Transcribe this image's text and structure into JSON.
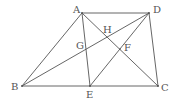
{
  "diagram": {
    "type": "geometry-figure",
    "points": [
      {
        "name": "A",
        "x": 82,
        "y": 13,
        "lx": 73,
        "ly": 13
      },
      {
        "name": "D",
        "x": 149,
        "y": 13,
        "lx": 153,
        "ly": 13
      },
      {
        "name": "B",
        "x": 22,
        "y": 86,
        "lx": 11,
        "ly": 90
      },
      {
        "name": "C",
        "x": 158,
        "y": 86,
        "lx": 161,
        "ly": 91
      },
      {
        "name": "E",
        "x": 90,
        "y": 86,
        "lx": 86,
        "ly": 98
      },
      {
        "name": "G",
        "x": 86,
        "y": 49,
        "lx": 76,
        "ly": 49
      },
      {
        "name": "H",
        "x": 107,
        "y": 37,
        "lx": 103,
        "ly": 33
      },
      {
        "name": "F",
        "x": 120,
        "y": 49,
        "lx": 124,
        "ly": 51
      }
    ],
    "segments": [
      [
        "A",
        "D"
      ],
      [
        "A",
        "B"
      ],
      [
        "B",
        "C"
      ],
      [
        "D",
        "C"
      ],
      [
        "A",
        "E"
      ],
      [
        "A",
        "C"
      ],
      [
        "B",
        "D"
      ],
      [
        "D",
        "E"
      ]
    ],
    "labels": {
      "A": "A",
      "B": "B",
      "C": "C",
      "D": "D",
      "E": "E",
      "F": "F",
      "G": "G",
      "H": "H"
    }
  }
}
